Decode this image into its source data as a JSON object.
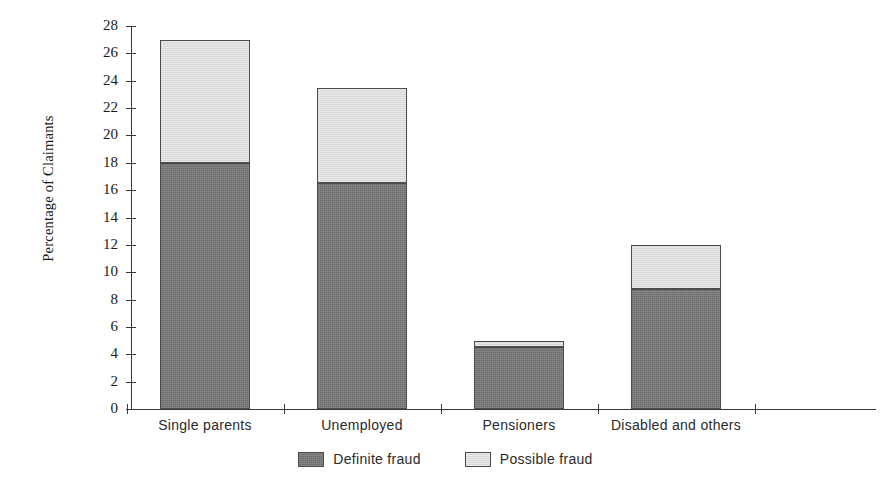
{
  "chart_data": {
    "type": "bar",
    "subtype": "stacked-bar",
    "title": "",
    "xlabel": "",
    "ylabel": "Percentage of Claimants",
    "categories": [
      "Single parents",
      "Unemployed",
      "Pensioners",
      "Disabled and others"
    ],
    "series": [
      {
        "name": "Definite fraud",
        "color": "#777777",
        "values": [
          18.0,
          16.5,
          4.5,
          8.8
        ]
      },
      {
        "name": "Possible fraud",
        "color": "#dcdcdc",
        "values": [
          9.0,
          7.0,
          0.5,
          3.2
        ]
      }
    ],
    "totals": [
      27.0,
      23.5,
      5.0,
      12.0
    ],
    "ylim": [
      0,
      28
    ],
    "ytick_step": 2,
    "yticks": [
      0,
      2,
      4,
      6,
      8,
      10,
      12,
      14,
      16,
      18,
      20,
      22,
      24,
      26,
      28
    ],
    "ytick_labels": [
      "0",
      "2",
      "4",
      "6",
      "8",
      "10",
      "12",
      "14",
      "16",
      "18",
      "20",
      "22",
      "24",
      "26",
      "28"
    ],
    "grid": false,
    "legend_position": "bottom-center",
    "legend": [
      "Definite fraud",
      "Possible fraud"
    ]
  },
  "axis": {
    "y_title": "Percentage of Claimants"
  }
}
